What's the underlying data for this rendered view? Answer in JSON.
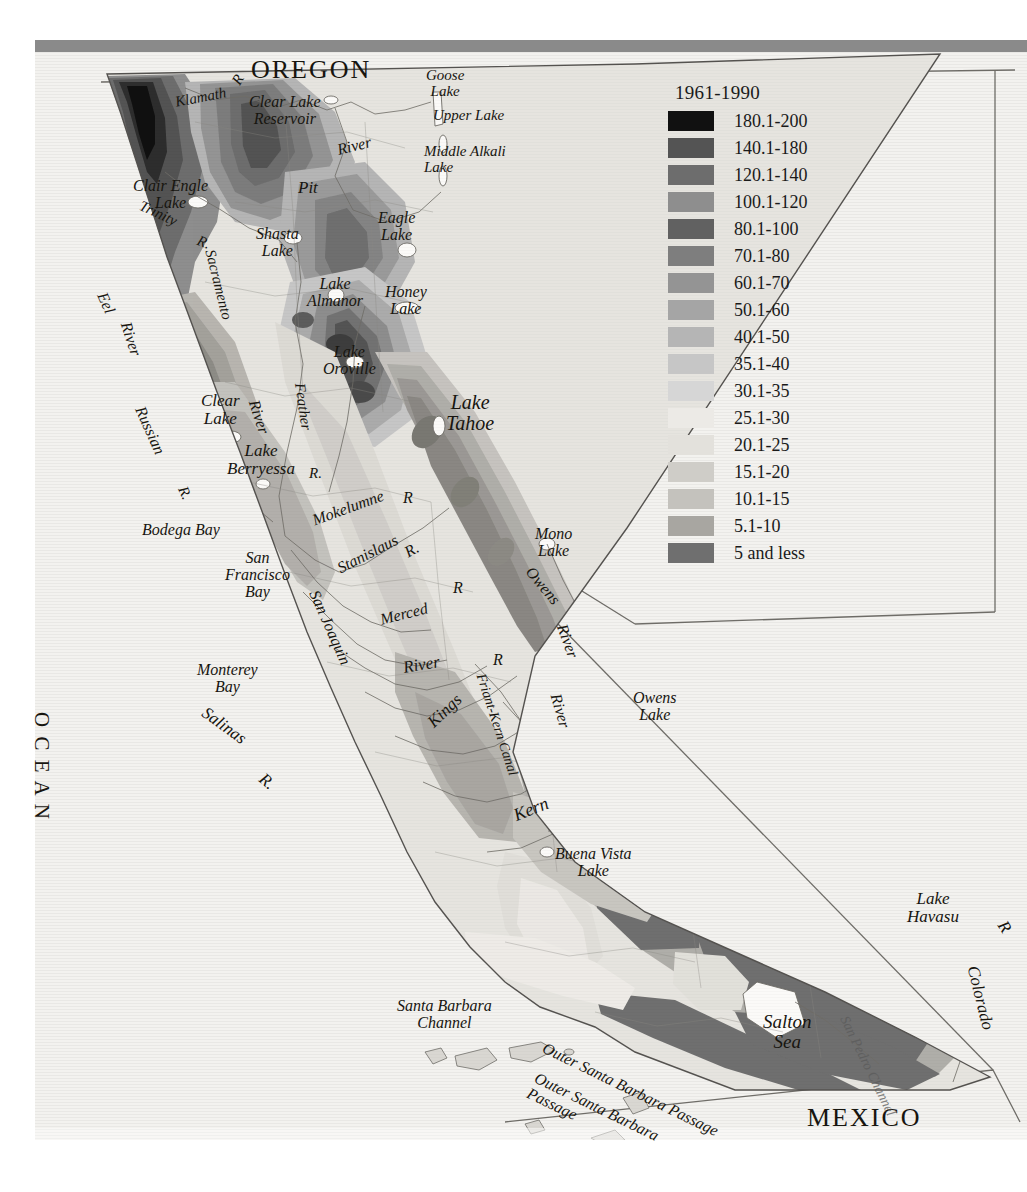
{
  "map": {
    "title_region": "California",
    "legend": {
      "title": "1961-1990",
      "entries": [
        {
          "label": "180.1-200",
          "color": "#111111"
        },
        {
          "label": "140.1-180",
          "color": "#545454"
        },
        {
          "label": "120.1-140",
          "color": "#6d6d6d"
        },
        {
          "label": "100.1-120",
          "color": "#8e8e8e"
        },
        {
          "label": "80.1-100",
          "color": "#616161"
        },
        {
          "label": "70.1-80",
          "color": "#7e7e7e"
        },
        {
          "label": "60.1-70",
          "color": "#949494"
        },
        {
          "label": "50.1-60",
          "color": "#a5a5a5"
        },
        {
          "label": "40.1-50",
          "color": "#b5b5b5"
        },
        {
          "label": "35.1-40",
          "color": "#c6c6c6"
        },
        {
          "label": "30.1-35",
          "color": "#d6d6d6"
        },
        {
          "label": "25.1-30",
          "color": "#eceae6"
        },
        {
          "label": "20.1-25",
          "color": "#e3e1dc"
        },
        {
          "label": "15.1-20",
          "color": "#cfcdc8"
        },
        {
          "label": "10.1-15",
          "color": "#c4c2bd"
        },
        {
          "label": "5.1-10",
          "color": "#a8a6a1"
        },
        {
          "label": "5 and less",
          "color": "#6f6f6f"
        }
      ]
    },
    "country_labels": [
      {
        "name": "oregon",
        "text": "OREGON"
      },
      {
        "name": "mexico",
        "text": "MEXICO"
      }
    ],
    "ocean_label": {
      "line1": "A C I F I C",
      "line2": "O C E A N"
    },
    "features": [
      {
        "name": "klamath-river",
        "text": "Klamath"
      },
      {
        "name": "klamath-river-r",
        "text": "R"
      },
      {
        "name": "clear-lake-reservoir",
        "text": "Clear Lake\nReservoir"
      },
      {
        "name": "goose-lake",
        "text": "Goose\nLake"
      },
      {
        "name": "upper-lake",
        "text": "Upper Lake"
      },
      {
        "name": "middle-alkali-lake",
        "text": "Middle Alkali\nLake"
      },
      {
        "name": "pit-river-river",
        "text": "River"
      },
      {
        "name": "pit-river",
        "text": "Pit"
      },
      {
        "name": "clair-engle-lake",
        "text": "Clair Engle\nLake"
      },
      {
        "name": "trinity-river",
        "text": "Trinity"
      },
      {
        "name": "trinity-river-r",
        "text": "R."
      },
      {
        "name": "shasta-lake",
        "text": "Shasta\nLake"
      },
      {
        "name": "eagle-lake",
        "text": "Eagle\nLake"
      },
      {
        "name": "sacramento-river",
        "text": "Sacramento"
      },
      {
        "name": "lake-almanor",
        "text": "Lake\nAlmanor"
      },
      {
        "name": "honey-lake",
        "text": "Honey\nLake"
      },
      {
        "name": "eel-river",
        "text": "Eel"
      },
      {
        "name": "eel-river-river",
        "text": "River"
      },
      {
        "name": "lake-oroville",
        "text": "Lake\nOroville"
      },
      {
        "name": "lake-tahoe",
        "text": "Lake\nTahoe"
      },
      {
        "name": "clear-lake",
        "text": "Clear\nLake"
      },
      {
        "name": "sacramento-river-2",
        "text": "River"
      },
      {
        "name": "feather-river",
        "text": "Feather"
      },
      {
        "name": "feather-river-r",
        "text": "R."
      },
      {
        "name": "russian-river",
        "text": "Russian"
      },
      {
        "name": "russian-river-r",
        "text": "R."
      },
      {
        "name": "lake-berryessa",
        "text": "Lake\nBerryessa"
      },
      {
        "name": "mokelumne-river",
        "text": "Mokelumne"
      },
      {
        "name": "mokelumne-river-r",
        "text": "R"
      },
      {
        "name": "mono-lake",
        "text": "Mono\nLake"
      },
      {
        "name": "bodega-bay",
        "text": "Bodega Bay"
      },
      {
        "name": "stanislaus-river",
        "text": "Stanislaus"
      },
      {
        "name": "stanislaus-river-r",
        "text": "R."
      },
      {
        "name": "san-francisco-bay",
        "text": "San\nFrancisco\nBay"
      },
      {
        "name": "san-joaquin-river",
        "text": "San Joaquin"
      },
      {
        "name": "merced-river",
        "text": "Merced"
      },
      {
        "name": "merced-river-r",
        "text": "R"
      },
      {
        "name": "owens-river",
        "text": "Owens"
      },
      {
        "name": "owens-river-river",
        "text": "River"
      },
      {
        "name": "monterey-bay",
        "text": "Monterey\nBay"
      },
      {
        "name": "san-joaquin-river-2",
        "text": "River"
      },
      {
        "name": "kings-river-r",
        "text": "R"
      },
      {
        "name": "owens-lake",
        "text": "Owens\nLake"
      },
      {
        "name": "salinas-river",
        "text": "Salinas"
      },
      {
        "name": "salinas-river-r",
        "text": "R."
      },
      {
        "name": "kings-river",
        "text": "Kings"
      },
      {
        "name": "friant-kern-canal",
        "text": "Friant-Kern Canal"
      },
      {
        "name": "kern-river-river",
        "text": "River"
      },
      {
        "name": "kern-river",
        "text": "Kern"
      },
      {
        "name": "buena-vista-lake",
        "text": "Buena Vista\nLake"
      },
      {
        "name": "lake-havasu",
        "text": "Lake\nHavasu"
      },
      {
        "name": "colorado-river",
        "text": "Colorado"
      },
      {
        "name": "colorado-river-r",
        "text": "R"
      },
      {
        "name": "santa-barbara-channel",
        "text": "Santa Barbara\nChannel"
      },
      {
        "name": "salton-sea",
        "text": "Salton\nSea"
      },
      {
        "name": "coachella-canal",
        "text": "Coachella Canal"
      },
      {
        "name": "san-pedro-channel",
        "text": "San Pedro Channel"
      },
      {
        "name": "outer-santa-barbara-passage",
        "text": "Outer Santa Barbara\nPassage"
      }
    ]
  }
}
